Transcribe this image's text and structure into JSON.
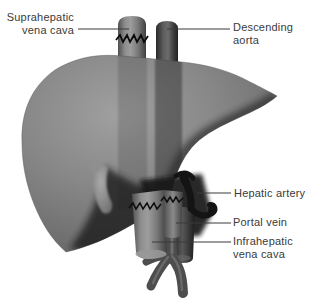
{
  "figure": {
    "type": "anatomical-illustration",
    "background_color": "#ffffff",
    "label_color": "#3a3a3a",
    "leader_line_color": "#3a3a3a"
  },
  "labels": {
    "suprahepatic": {
      "line1": "Suprahepatic",
      "line2": "vena cava"
    },
    "descending_aorta": {
      "line1": "Descending",
      "line2": "aorta"
    },
    "hepatic_artery": {
      "text": "Hepatic artery"
    },
    "portal_vein": {
      "text": "Portal vein"
    },
    "infrahepatic": {
      "line1": "Infrahepatic",
      "line2": "vena cava"
    }
  },
  "illustration": {
    "parts": [
      {
        "name": "liver",
        "color": "#868686"
      },
      {
        "name": "suprahepatic-vena-cava",
        "color": "#8e8e8e"
      },
      {
        "name": "descending-aorta",
        "color": "#4a4a4a"
      },
      {
        "name": "hepatic-artery",
        "color": "#141414"
      },
      {
        "name": "portal-vein",
        "color": "#6f6f6f"
      },
      {
        "name": "infrahepatic-vena-cava",
        "color": "#8e8e8e"
      },
      {
        "name": "aorta-bifurcation",
        "color": "#4d4d4d"
      },
      {
        "name": "gallbladder",
        "color": "#9b9b9b"
      },
      {
        "name": "suture-lines",
        "color": "#0f0f0f"
      }
    ]
  }
}
